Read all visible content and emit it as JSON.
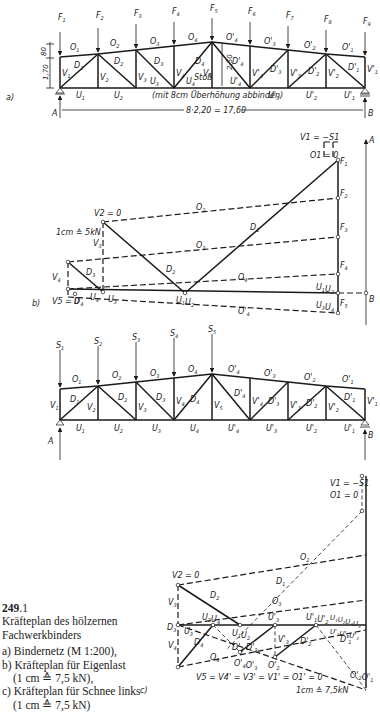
{
  "figure": {
    "number_bold": "249",
    "number_rest": ".1",
    "title_line1": "Kräfteplan des hölzernen",
    "title_line2": "Fachwerkbinders",
    "items": [
      {
        "text": "a) Bindernetz (M 1:200),"
      },
      {
        "text": "b) Kräfteplan für Eigenlast"
      },
      {
        "text": "(1 cm ≙ 7,5 kN),",
        "indent": true
      },
      {
        "text": "c) Kräfteplan für Schnee links"
      },
      {
        "text": "(1 cm ≙ 7,5 kN)",
        "indent": true
      }
    ]
  },
  "panel_a": {
    "label": "a)",
    "loads": [
      "F1",
      "F2",
      "F3",
      "F4",
      "F5",
      "F6",
      "F7",
      "F8",
      "F9"
    ],
    "upper_chords": [
      "O1",
      "O2",
      "O3",
      "O4",
      "O4'",
      "O3'",
      "O2'",
      "O1'"
    ],
    "lower_chords": [
      "U1",
      "U2",
      "U3",
      "U4",
      "U4'",
      "U3'",
      "U2'",
      "U1'"
    ],
    "verticals": [
      "V1",
      "V2",
      "V3",
      "V4",
      "V5",
      "V4'",
      "V3'",
      "V2'",
      "V1'"
    ],
    "diagonals": [
      "D1",
      "D2",
      "D3",
      "D4",
      "D4'",
      "D3'",
      "D2'",
      "D1'"
    ],
    "dim_top": "80",
    "dim_side": "1,70",
    "dim_mid": "2,50",
    "splice_label": "Stoß",
    "camber_note": "(mit 8cm Überhöhung abbinden)",
    "span": "8·2,20 = 17,60",
    "support_left": "A",
    "support_right": "B"
  },
  "panel_b": {
    "label": "b)",
    "scale": "1cm ≙ 5kN",
    "top_note": "V1 = −S1",
    "o1_zero": "O1 = 0",
    "v2_zero": "V2 = 0",
    "v5_zero": "V5 = 0",
    "forces": [
      "F1",
      "F2",
      "F3",
      "F4",
      "F5"
    ],
    "members": [
      "O2",
      "O3",
      "O4",
      "O4'",
      "D1",
      "D2",
      "D3",
      "D4",
      "V3",
      "V4",
      "U1U2",
      "U3U4",
      "U3",
      "U4",
      "U1 U2"
    ],
    "reaction_a": "A",
    "reaction_b": "B"
  },
  "panel_c_net": {
    "loads": [
      "S1",
      "S2",
      "S3",
      "S4",
      "S5"
    ],
    "upper_chords": [
      "O1",
      "O2",
      "O3",
      "O4",
      "O4'",
      "O3'",
      "O2'",
      "O1'"
    ],
    "lower_chords": [
      "U1",
      "U2",
      "U3",
      "U4",
      "U4'",
      "U3'",
      "U2'",
      "U1'"
    ],
    "verticals": [
      "V1",
      "V2",
      "V3",
      "V4",
      "V5",
      "V4'",
      "V3'",
      "V2'",
      "V1'"
    ],
    "diagonals": [
      "D1",
      "D2",
      "D3",
      "D4",
      "D4'",
      "D3'",
      "D2'",
      "D1'"
    ],
    "support_left": "A",
    "support_right": "B"
  },
  "panel_c": {
    "label": "c)",
    "top_note_1": "V1 = −S1",
    "top_note_2": "O1 = 0",
    "v2_zero": "V2 = 0",
    "zero_members": "V5 = V4' = V3' = V1' = O1' = 0",
    "scale": "1cm ≙ 7,5kN",
    "labels": [
      "O2",
      "O3",
      "D1",
      "D2",
      "D3",
      "D4",
      "V3",
      "V4",
      "O4",
      "U3",
      "U3U4",
      "U1U2",
      "U3'",
      "U1'U2'",
      "U1U2U3U4",
      "U1'U2'U3'",
      "D4'",
      "D3'",
      "D2'",
      "D1'",
      "V3'",
      "O4'O3'",
      "O2'",
      "O2'O1'"
    ]
  }
}
